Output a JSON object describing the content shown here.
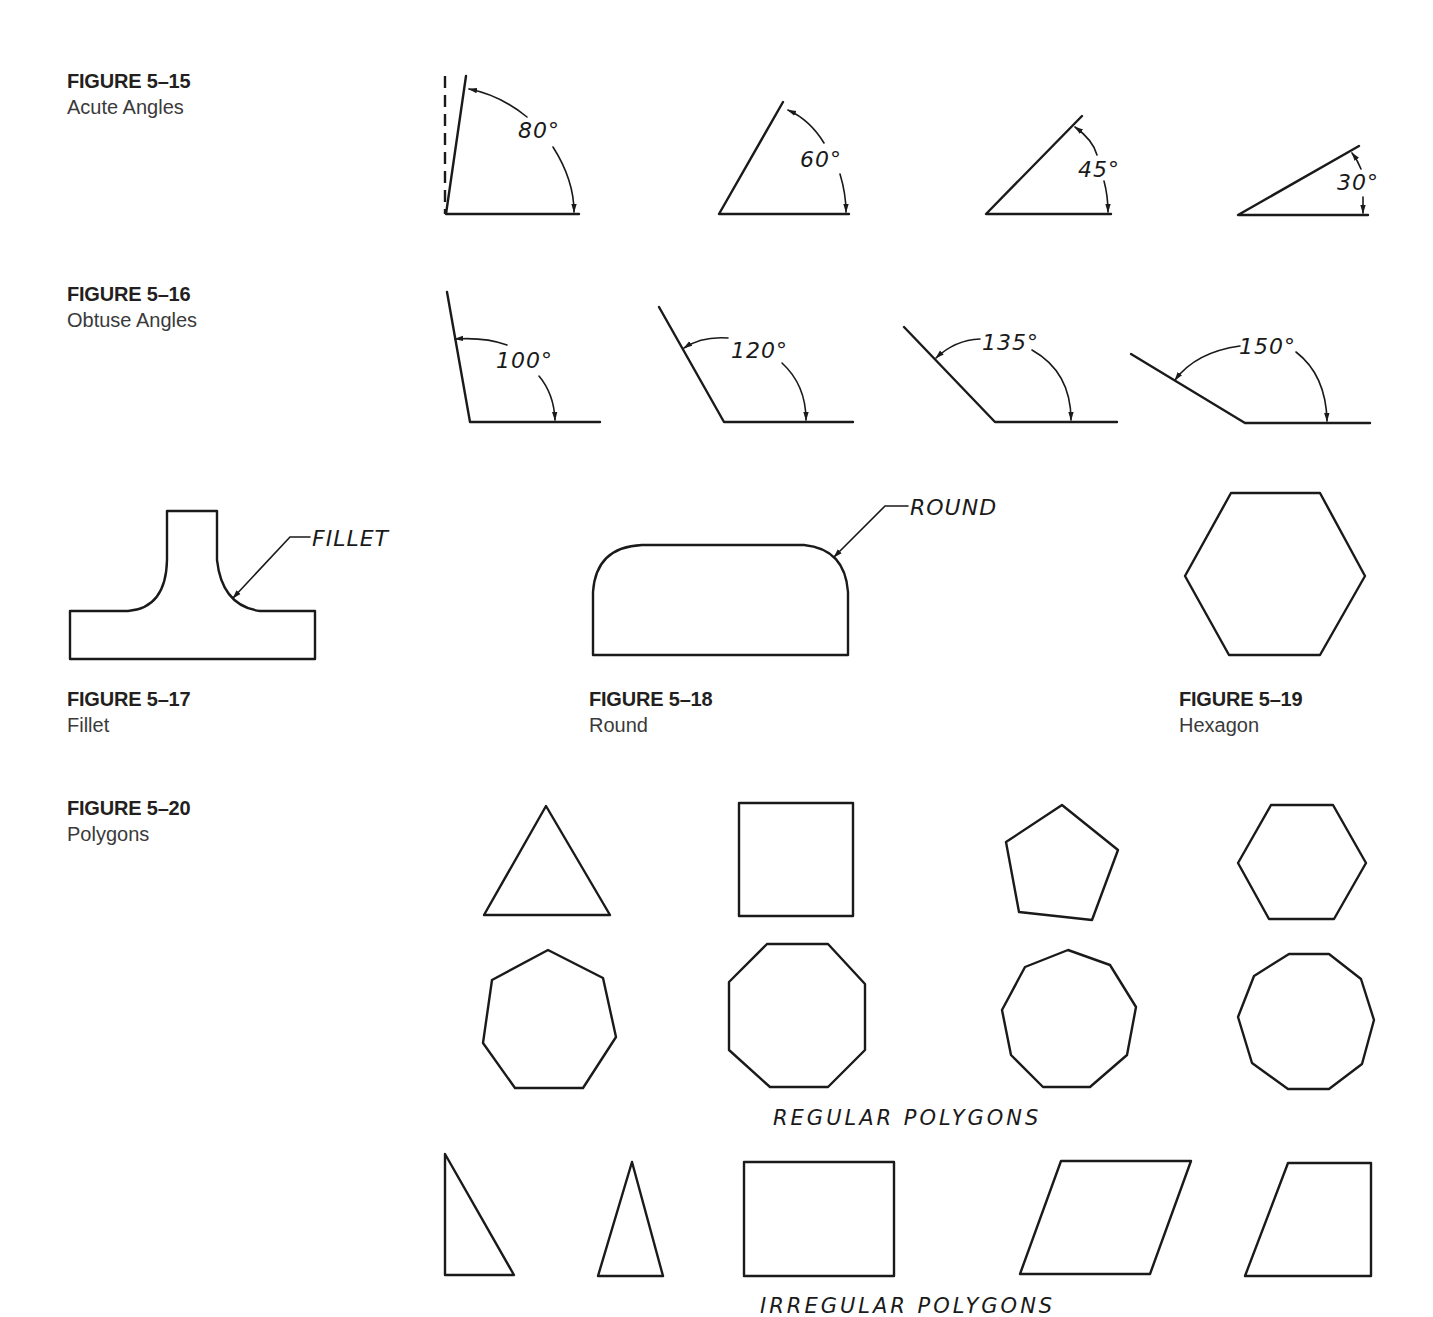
{
  "figures": {
    "fig15": {
      "number": "FIGURE 5–15",
      "title": "Acute Angles",
      "angles": [
        {
          "degrees": 80,
          "label": "80°"
        },
        {
          "degrees": 60,
          "label": "60°"
        },
        {
          "degrees": 45,
          "label": "45°"
        },
        {
          "degrees": 30,
          "label": "30°"
        }
      ]
    },
    "fig16": {
      "number": "FIGURE 5–16",
      "title": "Obtuse Angles",
      "angles": [
        {
          "degrees": 100,
          "label": "100°"
        },
        {
          "degrees": 120,
          "label": "120°"
        },
        {
          "degrees": 135,
          "label": "135°"
        },
        {
          "degrees": 150,
          "label": "150°"
        }
      ]
    },
    "fig17": {
      "number": "FIGURE 5–17",
      "title": "Fillet",
      "leader_label": "FILLET"
    },
    "fig18": {
      "number": "FIGURE 5–18",
      "title": "Round",
      "leader_label": "ROUND"
    },
    "fig19": {
      "number": "FIGURE 5–19",
      "title": "Hexagon"
    },
    "fig20": {
      "number": "FIGURE 5–20",
      "title": "Polygons",
      "regular_label": "REGULAR POLYGONS",
      "irregular_label": "IRREGULAR POLYGONS",
      "regular_sides": [
        3,
        4,
        5,
        6,
        7,
        8,
        9,
        10
      ],
      "irregular_shapes": [
        "right-triangle",
        "isosceles-triangle",
        "rectangle",
        "parallelogram",
        "trapezoid"
      ]
    }
  }
}
